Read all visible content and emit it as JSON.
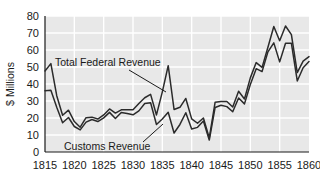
{
  "chart_data": {
    "type": "line",
    "title": "",
    "xlabel": "",
    "ylabel": "$ Millions",
    "xlim": [
      1815,
      1860
    ],
    "ylim": [
      0,
      80
    ],
    "grid": true,
    "legend_position": "inline-annotations",
    "xticks": [
      "1815",
      "1820",
      "1825",
      "1830",
      "1835",
      "1840",
      "1845",
      "1850",
      "1855",
      "1860"
    ],
    "yticks": [
      "0",
      "10",
      "20",
      "30",
      "40",
      "50",
      "60",
      "70",
      "80"
    ],
    "x": [
      1815,
      1816,
      1817,
      1818,
      1819,
      1820,
      1821,
      1822,
      1823,
      1824,
      1825,
      1826,
      1827,
      1828,
      1829,
      1830,
      1831,
      1832,
      1833,
      1834,
      1835,
      1836,
      1837,
      1838,
      1839,
      1840,
      1841,
      1842,
      1843,
      1844,
      1845,
      1846,
      1847,
      1848,
      1849,
      1850,
      1851,
      1852,
      1853,
      1854,
      1855,
      1856,
      1857,
      1858,
      1859,
      1860
    ],
    "series": [
      {
        "name": "Total Federal Revenue",
        "color": "#2b2b2b",
        "values": [
          47.7,
          52.0,
          33.1,
          21.6,
          24.6,
          17.9,
          14.6,
          20.2,
          20.5,
          19.4,
          21.8,
          25.3,
          22.9,
          24.8,
          24.8,
          24.8,
          28.5,
          31.9,
          33.9,
          21.8,
          35.4,
          50.8,
          25.0,
          26.3,
          31.5,
          19.5,
          16.9,
          20.0,
          8.3,
          29.3,
          29.7,
          29.7,
          26.5,
          35.7,
          31.2,
          43.6,
          52.6,
          49.8,
          61.6,
          73.8,
          65.4,
          74.1,
          69.0,
          46.7,
          53.5,
          56.1
        ]
      },
      {
        "name": "Customs Revenue",
        "color": "#2b2b2b",
        "values": [
          36.0,
          36.3,
          26.3,
          17.2,
          20.3,
          15.0,
          13.0,
          17.6,
          19.1,
          17.9,
          20.1,
          23.3,
          19.7,
          23.2,
          22.7,
          21.9,
          24.2,
          28.5,
          29.0,
          16.2,
          19.4,
          23.4,
          11.2,
          16.2,
          23.1,
          13.5,
          14.5,
          18.2,
          7.0,
          26.2,
          27.5,
          26.7,
          23.7,
          31.8,
          28.3,
          39.7,
          49.0,
          47.3,
          58.9,
          64.2,
          53.0,
          64.0,
          63.9,
          41.8,
          49.6,
          53.2
        ]
      }
    ],
    "annotations": [
      {
        "label": "Total Federal Revenue",
        "series": "Total Federal Revenue",
        "text_x": 55,
        "text_y": 66,
        "leader_from_x": 129,
        "leader_from_y": 70,
        "leader_to_x": 166,
        "leader_to_y": 92
      },
      {
        "label": "Customs Revenue",
        "series": "Customs Revenue",
        "text_x": 64,
        "text_y": 150,
        "leader_from_x": 143,
        "leader_from_y": 142,
        "leader_to_x": 163,
        "leader_to_y": 124
      }
    ]
  },
  "style": {
    "plot_background": "#e8e8e8",
    "gridline_color": "#ffffff",
    "page_background": "#ffffff",
    "text_color": "#1a1a1a",
    "line_color": "#2b2b2b"
  }
}
